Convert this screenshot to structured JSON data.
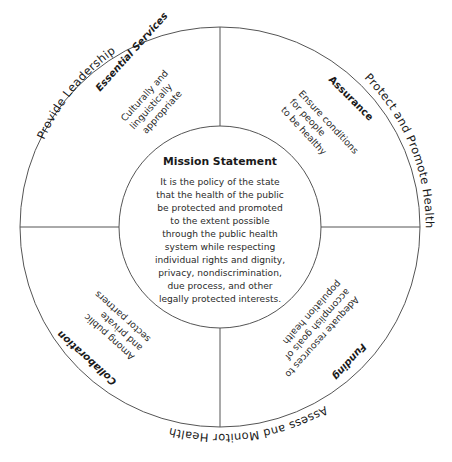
{
  "outer_labels": {
    "top_left": "Provide Leadership",
    "right": "Protect and Promote Health",
    "bottom": "Assess and Monitor Health"
  },
  "quadrants": {
    "top_left": {
      "title": "Essential Services",
      "lines": [
        "Culturally and",
        "linguistically",
        "appropriate"
      ]
    },
    "top_right": {
      "title": "Assurance",
      "lines": [
        "Ensure conditions",
        "for people",
        "to be healthy"
      ]
    },
    "bottom_right": {
      "title": "Funding",
      "lines": [
        "Adequate resources to",
        "accomplish goals of",
        "population health"
      ]
    },
    "bottom_left": {
      "title": "Collaboration",
      "lines": [
        "Among public",
        "and private",
        "sector partners"
      ]
    }
  },
  "mission": {
    "title": "Mission Statement",
    "lines": [
      "It is the policy of the state",
      "that the health of the public",
      "be protected and promoted",
      "to the extent possible",
      "through the public health",
      "system while respecting",
      "individual rights and dignity,",
      "privacy, nondiscrimination,",
      "due process, and other",
      "legally protected interests."
    ]
  }
}
